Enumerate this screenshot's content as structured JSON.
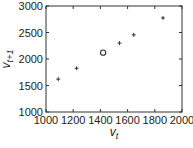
{
  "chart_data": {
    "type": "scatter",
    "title": "",
    "xlabel": "v_t",
    "ylabel": "v_{t+1}",
    "xlim": [
      1000,
      2000
    ],
    "ylim": [
      1000,
      3000
    ],
    "x_ticks": [
      1000,
      1200,
      1400,
      1600,
      1800,
      2000
    ],
    "y_ticks": [
      1000,
      1500,
      2000,
      2500,
      3000
    ],
    "grid": false,
    "legend": null,
    "series": [
      {
        "name": "plus-markers",
        "marker": "+",
        "points": [
          {
            "x": 1090,
            "y": 1620
          },
          {
            "x": 1225,
            "y": 1825
          },
          {
            "x": 1540,
            "y": 2300
          },
          {
            "x": 1645,
            "y": 2455
          },
          {
            "x": 1860,
            "y": 2775
          }
        ]
      },
      {
        "name": "circle-marker",
        "marker": "o",
        "points": [
          {
            "x": 1420,
            "y": 2120
          }
        ]
      }
    ]
  },
  "labels": {
    "xlabel_main": "v",
    "xlabel_sub": "t",
    "ylabel_main": "v",
    "ylabel_sub": "t+1"
  },
  "colors": {
    "axis": "#333333",
    "marker": "#333333"
  }
}
